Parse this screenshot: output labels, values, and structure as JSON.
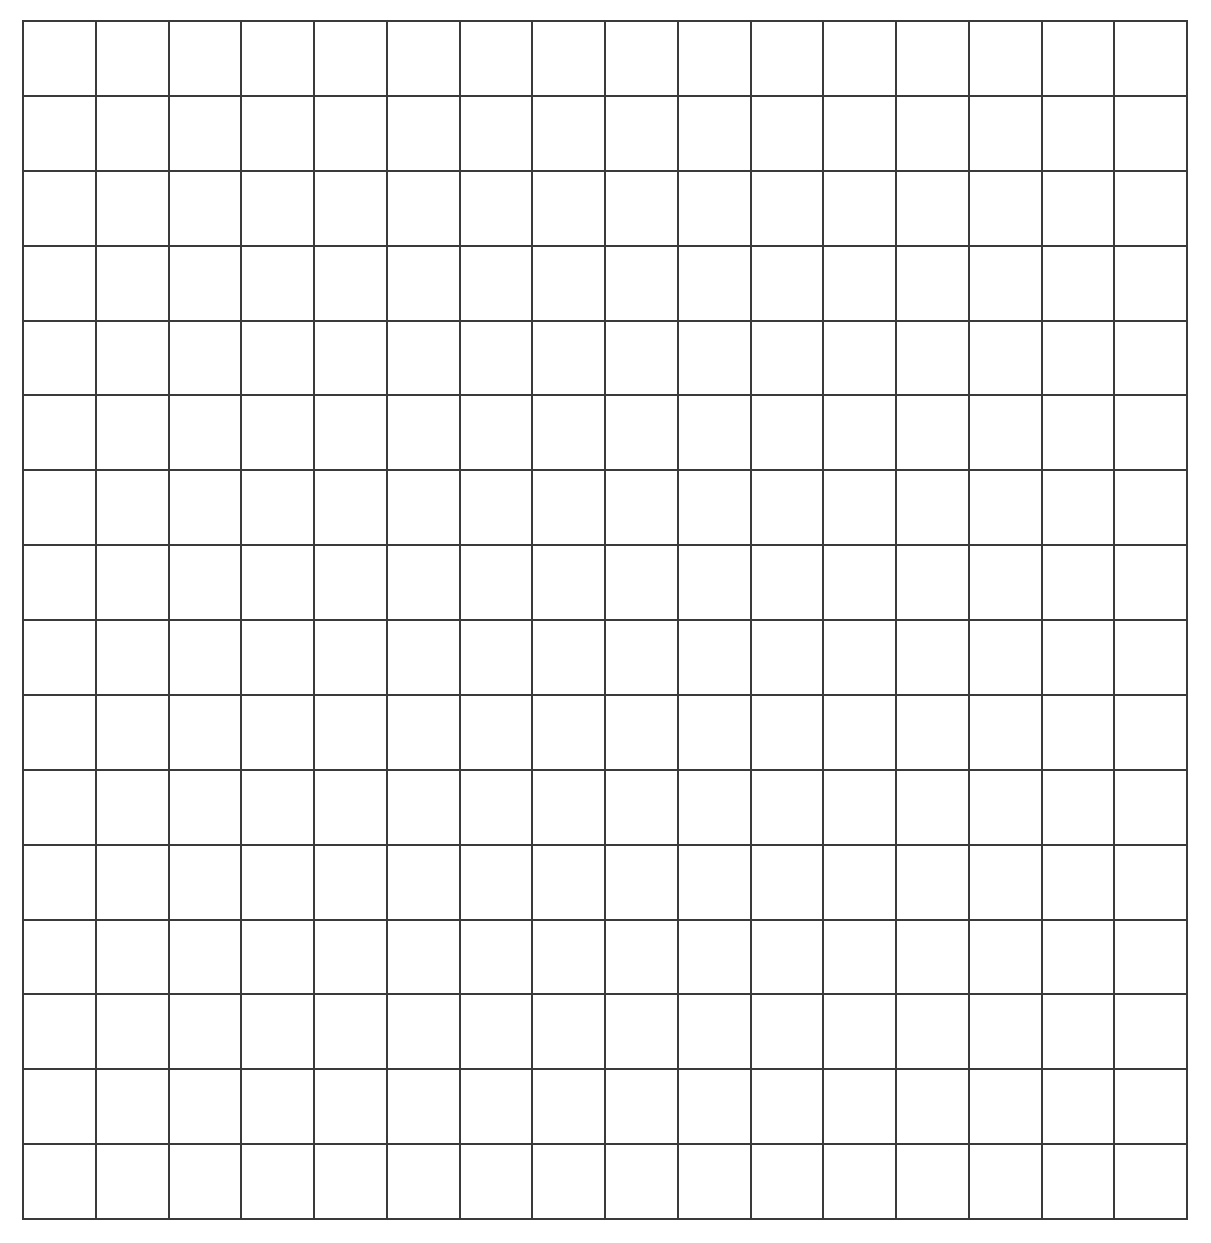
{
  "grid": {
    "rows": 16,
    "columns": 16,
    "line_color": "#3a3a3a",
    "background_color": "#ffffff",
    "cells_filled": []
  }
}
